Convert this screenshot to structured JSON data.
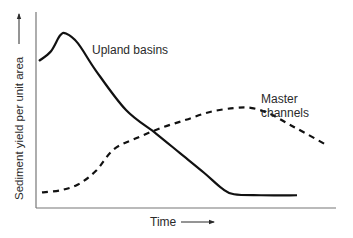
{
  "chart_data": {
    "type": "line",
    "title": "",
    "xlabel": "Time",
    "ylabel": "Sediment yield per unit area",
    "xlim": [
      0,
      100
    ],
    "ylim": [
      0,
      100
    ],
    "grid": false,
    "ticks": "none",
    "series": [
      {
        "name": "Upland basins",
        "style": "solid",
        "color": "#111111",
        "x": [
          1,
          5,
          8,
          10,
          14,
          20,
          30,
          40,
          48,
          56,
          62,
          66,
          75,
          87
        ],
        "y": [
          75,
          80,
          88,
          89,
          84,
          70,
          50,
          38,
          28,
          18,
          10,
          7,
          6.5,
          6.5
        ]
      },
      {
        "name": "Master channels",
        "style": "dashed",
        "color": "#111111",
        "x": [
          2,
          8,
          14,
          20,
          26,
          34,
          42,
          50,
          58,
          66,
          72,
          78,
          84,
          90,
          97
        ],
        "y": [
          8,
          9,
          12,
          19,
          30,
          36,
          41,
          45,
          49,
          51,
          51,
          48,
          43,
          38,
          32
        ]
      }
    ],
    "annotations": [
      {
        "text": "Upland basins",
        "series": "Upland basins"
      },
      {
        "text": "Master\nchannels",
        "series": "Master channels"
      }
    ]
  },
  "labels": {
    "upland": "Upland basins",
    "master_line1": "Master",
    "master_line2": "channels",
    "xlabel": "Time",
    "ylabel": "Sediment yield per unit area"
  }
}
